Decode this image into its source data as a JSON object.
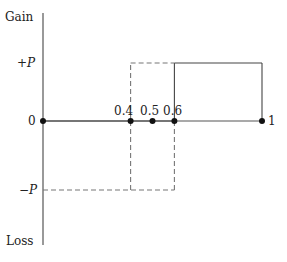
{
  "diagram": {
    "y_axis": {
      "top_label": "Gain",
      "bottom_label": "Loss",
      "levels": [
        {
          "id": "plus_p",
          "sign": "+",
          "symbol": "P",
          "value": "+P"
        },
        {
          "id": "zero",
          "value": "0"
        },
        {
          "id": "minus_p",
          "sign": "−",
          "symbol": "P",
          "value": "-P"
        }
      ]
    },
    "x_axis": {
      "points": [
        {
          "id": "p0",
          "label": "0",
          "x": 0
        },
        {
          "id": "p04",
          "label": "0.4",
          "x": 0.4
        },
        {
          "id": "p05",
          "label": "0.5",
          "x": 0.5
        },
        {
          "id": "p06",
          "label": "0.6",
          "x": 0.6
        },
        {
          "id": "p1",
          "label": "1",
          "x": 1
        }
      ]
    },
    "payoff_solid": {
      "description": "Gain +P for x in [0.6, 1], 0 otherwise",
      "segments": [
        {
          "from": [
            0,
            0
          ],
          "to": [
            0.6,
            0
          ]
        },
        {
          "from": [
            0.6,
            0
          ],
          "to": [
            0.6,
            1
          ]
        },
        {
          "from": [
            0.6,
            1
          ],
          "to": [
            1,
            1
          ]
        },
        {
          "from": [
            1,
            1
          ],
          "to": [
            1,
            0
          ]
        }
      ]
    },
    "payoff_dashed": {
      "description": "Loss -P for x in [0, 0.4], +P on [0.4, 0.6] then down to -P at 0.6",
      "segments": [
        {
          "from": [
            0,
            -1
          ],
          "to": [
            0.6,
            -1
          ]
        },
        {
          "from": [
            0.4,
            -1
          ],
          "to": [
            0.4,
            1
          ]
        },
        {
          "from": [
            0.4,
            1
          ],
          "to": [
            0.6,
            1
          ]
        },
        {
          "from": [
            0.6,
            0
          ],
          "to": [
            0.6,
            -1
          ]
        }
      ]
    }
  }
}
